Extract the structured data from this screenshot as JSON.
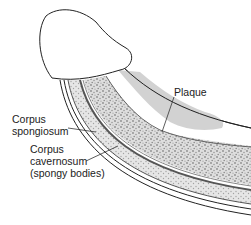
{
  "diagram": {
    "colors": {
      "outline": "#222222",
      "tissue_fill": "#d9d9d9",
      "speckle": "#8c8c8c",
      "plaque": "#cfcfcf",
      "background": "#ffffff"
    },
    "labels": {
      "plaque": {
        "text": "Plaque"
      },
      "corpus_spongiosum": {
        "line1": "Corpus",
        "line2": "spongiosum"
      },
      "corpus_cavernosum": {
        "line1": "Corpus",
        "line2": "cavernosum",
        "line3": "(spongy bodies)"
      }
    }
  }
}
